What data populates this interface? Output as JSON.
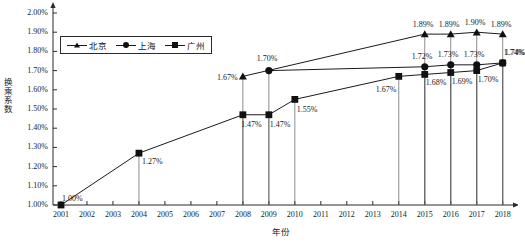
{
  "chart_data": {
    "type": "line",
    "title": "",
    "xlabel": "年份",
    "ylabel": "换乘系数",
    "ylim": [
      1.0,
      2.0
    ],
    "ystep": 0.1,
    "grid": false,
    "legend_position": "top-left",
    "x": [
      "2001",
      "2002",
      "2003",
      "2004",
      "2005",
      "2006",
      "2007",
      "2008",
      "2009",
      "2010",
      "2011",
      "2012",
      "2013",
      "2014",
      "2015",
      "2016",
      "2017",
      "2018"
    ],
    "yticks": [
      "1.00%",
      "1.10%",
      "1.20%",
      "1.30%",
      "1.40%",
      "1.50%",
      "1.60%",
      "1.70%",
      "1.80%",
      "1.90%",
      "2.00%"
    ],
    "series": [
      {
        "name": "北京",
        "marker": "triangle",
        "points": [
          {
            "x": "2008",
            "y": 1.67,
            "label": "1.67%"
          },
          {
            "x": "2015",
            "y": 1.89,
            "label": "1.89%"
          },
          {
            "x": "2016",
            "y": 1.89,
            "label": "1.89%"
          },
          {
            "x": "2017",
            "y": 1.9,
            "label": "1.90%"
          },
          {
            "x": "2018",
            "y": 1.89,
            "label": "1.89%"
          }
        ]
      },
      {
        "name": "上海",
        "marker": "circle",
        "points": [
          {
            "x": "2009",
            "y": 1.7,
            "label": "1.70%"
          },
          {
            "x": "2015",
            "y": 1.72,
            "label": "1.72%"
          },
          {
            "x": "2016",
            "y": 1.73,
            "label": "1.73%"
          },
          {
            "x": "2017",
            "y": 1.73,
            "label": "1.73%"
          },
          {
            "x": "2018",
            "y": 1.74,
            "label": "1.74%"
          }
        ]
      },
      {
        "name": "广州",
        "marker": "square",
        "points": [
          {
            "x": "2001",
            "y": 1.0,
            "label": "1.00%"
          },
          {
            "x": "2004",
            "y": 1.27,
            "label": "1.27%"
          },
          {
            "x": "2008",
            "y": 1.47,
            "label": "1.47%"
          },
          {
            "x": "2009",
            "y": 1.47,
            "label": "1.47%"
          },
          {
            "x": "2010",
            "y": 1.55,
            "label": "1.55%"
          },
          {
            "x": "2014",
            "y": 1.67,
            "label": "1.67%"
          },
          {
            "x": "2015",
            "y": 1.68,
            "label": "1.68%"
          },
          {
            "x": "2016",
            "y": 1.69,
            "label": "1.69%"
          },
          {
            "x": "2017",
            "y": 1.7,
            "label": "1.70%"
          },
          {
            "x": "2018",
            "y": 1.74,
            "label": "1.74%"
          }
        ]
      }
    ],
    "colors": {
      "line": "#1b1b1b",
      "marker": "#111111",
      "axis": "#2b2b2b",
      "text": "#1a1a1a"
    }
  },
  "legend": {
    "items": [
      {
        "label": "北京",
        "marker": "triangle"
      },
      {
        "label": "上海",
        "marker": "circle"
      },
      {
        "label": "广州",
        "marker": "square"
      }
    ]
  },
  "axes": {
    "y_title": "换乘系数",
    "x_title": "年份"
  }
}
